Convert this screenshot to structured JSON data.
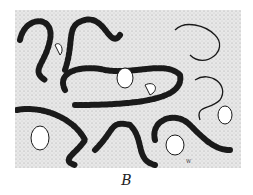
{
  "figure": {
    "label": "B",
    "signature": "W",
    "colors": {
      "background_stipple": "#e4e4e4",
      "lumen": "#ffffff",
      "ink": "#1a1a1a"
    }
  }
}
